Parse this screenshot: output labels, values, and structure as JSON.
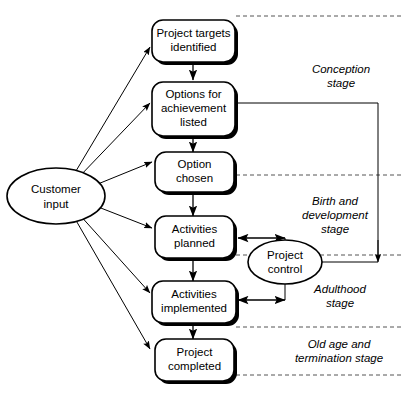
{
  "diagram": {
    "background_color": "#ffffff",
    "line_color": "#000000",
    "divider_color": "#555555"
  },
  "nodes": {
    "customer_input": {
      "label_line1": "Customer",
      "label_line2": "input",
      "shape": "ellipse"
    },
    "project_control": {
      "label_line1": "Project",
      "label_line2": "control",
      "shape": "ellipse"
    },
    "boxes": [
      {
        "id": "project-targets-identified",
        "lines": [
          "Project targets",
          "identified"
        ],
        "shape": "rounded-rect"
      },
      {
        "id": "options-for-achievement-listed",
        "lines": [
          "Options for",
          "achievement",
          "listed"
        ],
        "shape": "rounded-rect"
      },
      {
        "id": "option-chosen",
        "lines": [
          "Option",
          "chosen"
        ],
        "shape": "rounded-rect"
      },
      {
        "id": "activities-planned",
        "lines": [
          "Activities",
          "planned"
        ],
        "shape": "rounded-rect"
      },
      {
        "id": "activities-implemented",
        "lines": [
          "Activities",
          "implemented"
        ],
        "shape": "rounded-rect"
      },
      {
        "id": "project-completed",
        "lines": [
          "Project",
          "completed"
        ],
        "shape": "rounded-rect"
      }
    ]
  },
  "stages": [
    {
      "id": "conception-stage",
      "lines": [
        "Conception",
        "stage"
      ]
    },
    {
      "id": "birth-and-development-stage",
      "lines": [
        "Birth and",
        "development",
        "stage"
      ]
    },
    {
      "id": "adulthood-stage",
      "lines": [
        "Adulthood",
        "stage"
      ]
    },
    {
      "id": "old-age-and-termination-stage",
      "lines": [
        "Old age and",
        "termination stage"
      ]
    }
  ]
}
